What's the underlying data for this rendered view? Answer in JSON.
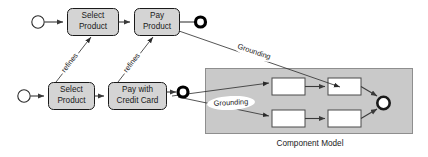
{
  "figure": {
    "caption": "Component Model"
  },
  "abstract_process": {
    "name": "abstract-process-lane",
    "start_node": "start-node",
    "end_node": "end-node",
    "activities": [
      {
        "id": "select-product-abstract",
        "line1": "Select",
        "line2": "Product"
      },
      {
        "id": "pay-product-abstract",
        "line1": "Pay",
        "line2": "Product"
      }
    ]
  },
  "refined_process": {
    "name": "refined-process-lane",
    "start_node": "start-node",
    "end_node": "end-node",
    "activities": [
      {
        "id": "select-product-refined",
        "line1": "Select",
        "line2": "Product"
      },
      {
        "id": "pay-with-credit-card",
        "line1": "Pay with",
        "line2": "Credit Card"
      }
    ]
  },
  "relations": {
    "refines": [
      {
        "id": "refines-select-product",
        "label": "refines"
      },
      {
        "id": "refines-pay-product",
        "label": "refines"
      }
    ],
    "grounding": [
      {
        "id": "grounding-upper",
        "label": "Grounding"
      },
      {
        "id": "grounding-lower",
        "label": "Grounding"
      }
    ]
  },
  "component_model": {
    "name": "component-model-panel",
    "caption": "Component Model",
    "components": [
      {
        "id": "component-top-left",
        "label": ""
      },
      {
        "id": "component-top-right",
        "label": ""
      },
      {
        "id": "component-bottom-left",
        "label": ""
      },
      {
        "id": "component-bottom-right",
        "label": ""
      }
    ],
    "end_node": "component-end-node"
  },
  "colors": {
    "activity_fill": "#d4d4d4",
    "panel_fill": "#c9c9c9",
    "component_fill": "#ffffff",
    "stroke": "#1a1a1a",
    "background": "#ffffff"
  }
}
